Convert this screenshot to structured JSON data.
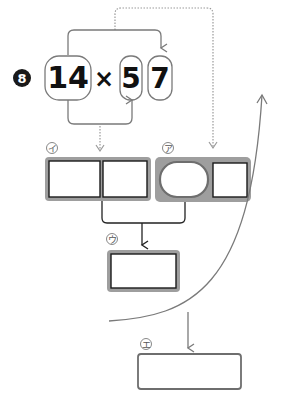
{
  "problem": {
    "number": "8",
    "operand_left": "14",
    "operator": "×",
    "operand_right_tens": "5",
    "operand_right_ones": "7"
  },
  "boxes": {
    "i": {
      "label": "イ",
      "description": "two-cell result box (partial product 14×7)"
    },
    "a": {
      "label": "ア",
      "description": "oval + square box (partial product 14×50)"
    },
    "u": {
      "label": "ウ",
      "description": "sum box"
    },
    "e": {
      "label": "エ",
      "description": "final answer box"
    }
  },
  "colors": {
    "line": "#7a7a7a",
    "dotted": "#9a9a9a",
    "box_fill": "#9e9e9e",
    "cell_border": "#1a1a1a",
    "badge": "#1a1a1a"
  }
}
